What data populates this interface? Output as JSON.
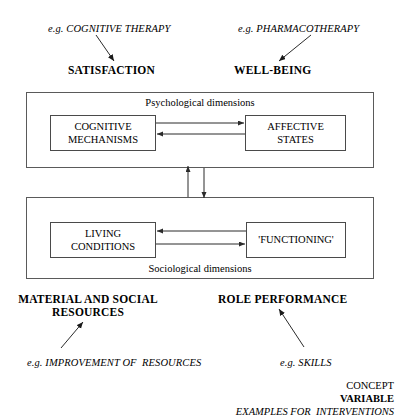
{
  "figure": {
    "top_interventions": [
      {
        "text": "e.g. COGNITIVE THERAPY"
      },
      {
        "text": "e.g. PHARMACOTHERAPY"
      }
    ],
    "top_concepts": [
      {
        "text": "SATISFACTION"
      },
      {
        "text": "WELL-BEING"
      }
    ],
    "psychological": {
      "caption": "Psychological dimensions",
      "left_variable": "COGNITIVE\nMECHANISMS",
      "right_variable": "AFFECTIVE\nSTATES"
    },
    "sociological": {
      "caption": "Sociological dimensions",
      "left_variable": "LIVING\nCONDITIONS",
      "right_variable": "'FUNCTIONING'"
    },
    "bottom_concepts": [
      {
        "text": "MATERIAL AND SOCIAL\nRESOURCES"
      },
      {
        "text": "ROLE PERFORMANCE"
      }
    ],
    "bottom_interventions": [
      {
        "text": "e.g. IMPROVEMENT OF  RESOURCES"
      },
      {
        "text": "e.g. SKILLS"
      }
    ],
    "legend": {
      "concept": "CONCEPT",
      "variable": "VARIABLE",
      "examples": "EXAMPLES FOR  INTERVENTIONS"
    },
    "colors": {
      "stroke": "#4a4a4a",
      "outer_stroke": "#5a5a5a",
      "text": "#000000",
      "background": "#ffffff"
    }
  }
}
